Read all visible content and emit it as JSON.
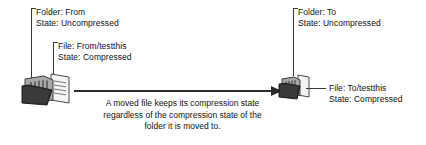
{
  "diagram": {
    "title_caption": {
      "lines": [
        "A moved file keeps its compression state",
        "regardless of the compression state of the",
        "folder it is moved to."
      ]
    },
    "annotations": {
      "source_folder": {
        "line1": "Folder: From",
        "line2": "State: Uncompressed"
      },
      "source_file": {
        "line1": "File: From/testthis",
        "line2": "State: Compressed"
      },
      "target_folder": {
        "line1": "Folder: To",
        "line2": "State: Uncompressed"
      },
      "target_file": {
        "line1": "File: To/testthis",
        "line2": "State: Compressed"
      }
    },
    "icons": {
      "source": "open-folder-with-document-icon",
      "target": "folder-with-document-icon",
      "arrow": "move-arrow-icon"
    },
    "colors": {
      "background": "#ffffff",
      "text": "#111111",
      "line": "#3a3a3a",
      "arrow": "#2b2b2b",
      "folder_body": "#8c8c8c",
      "folder_dark": "#3d3d3d",
      "paper": "#f2f2f2"
    }
  }
}
